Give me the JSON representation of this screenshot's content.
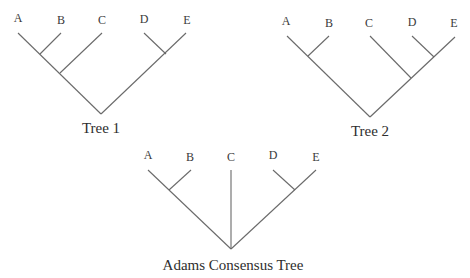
{
  "diagram": {
    "type": "phylogenetic-trees",
    "colors": {
      "line": "#6a6a6a",
      "text": "#3a3a3a",
      "background": "#ffffff"
    },
    "trees": [
      {
        "caption": "Tree 1",
        "newick": "(((A,B),C),(D,E))",
        "taxa": [
          "A",
          "B",
          "C",
          "D",
          "E"
        ]
      },
      {
        "caption": "Tree 2",
        "newick": "((A,B),(C,(D,E)))",
        "taxa": [
          "A",
          "B",
          "C",
          "D",
          "E"
        ]
      },
      {
        "caption": "Adams Consensus Tree",
        "newick": "((A,B),C,(D,E))",
        "taxa": [
          "A",
          "B",
          "C",
          "D",
          "E"
        ]
      }
    ]
  }
}
